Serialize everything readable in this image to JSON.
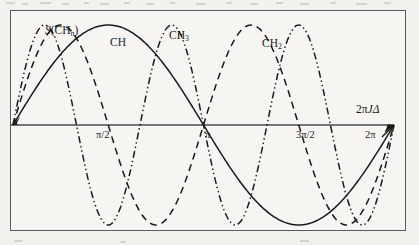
{
  "figure": {
    "axis": {
      "x_axis_label": "2πJΔ",
      "x_axis_label_parts": {
        "prefix": "2π",
        "italic": "J",
        "suffix": "Δ"
      },
      "tick_labels": [
        "π/2",
        "π",
        "3π/2",
        "2π"
      ],
      "tick_values": [
        1.5708,
        3.1416,
        4.7124,
        6.2832
      ]
    },
    "series_labels": {
      "intensity": {
        "italic": "S",
        "rest": "(CH",
        "sub": "n",
        "close": ")"
      },
      "ch": "CH",
      "ch3_main": "CH",
      "ch3_sub": "3",
      "ch2_main": "CH",
      "ch2_sub": "2"
    },
    "colors": {
      "ink": "#1a1a1a",
      "frame": "#5b5b5b",
      "axis": "#4a4a4a",
      "paper": "#f6f5f2",
      "page": "#f2f1ee"
    }
  },
  "chart_data": {
    "type": "line",
    "title": "",
    "xlabel": "2πJΔ",
    "ylabel": "S(CHn)",
    "xlim": [
      0,
      6.2832
    ],
    "ylim": [
      -1.12,
      1.12
    ],
    "grid": false,
    "legend": "inline-curve-labels",
    "x_ticks": [
      1.5708,
      3.1416,
      4.7124,
      6.2832
    ],
    "x_tick_labels": [
      "π/2",
      "π",
      "3π/2",
      "2π"
    ],
    "annotations": [
      {
        "text": "S(CHn)",
        "x": 0.55,
        "y": 1.02
      },
      {
        "text": "CH",
        "x": 1.62,
        "y": 1.06
      },
      {
        "text": "CH3",
        "x": 2.75,
        "y": 1.06
      },
      {
        "text": "CH2",
        "x": 4.35,
        "y": 0.98
      },
      {
        "text": "2πJΔ",
        "x": 6.05,
        "y": 0.21
      }
    ],
    "series": [
      {
        "name": "CH",
        "label": "CH",
        "linestyle": "solid",
        "formula": "sin(x)",
        "x": [
          0,
          0.3927,
          0.7854,
          1.1781,
          1.5708,
          1.9635,
          2.3562,
          2.7489,
          3.1416,
          3.5343,
          3.927,
          4.3197,
          4.7124,
          5.1051,
          5.4978,
          5.8905,
          6.2832
        ],
        "values": [
          0,
          0.383,
          0.707,
          0.924,
          1,
          0.924,
          0.707,
          0.383,
          0,
          -0.383,
          -0.707,
          -0.924,
          -1,
          -0.924,
          -0.707,
          -0.383,
          0
        ]
      },
      {
        "name": "CH2",
        "label": "CH2",
        "linestyle": "dashed",
        "formula": "sin(2x)",
        "x": [
          0,
          0.3927,
          0.7854,
          1.1781,
          1.5708,
          1.9635,
          2.3562,
          2.7489,
          3.1416,
          3.5343,
          3.927,
          4.3197,
          4.7124,
          5.1051,
          5.4978,
          5.8905,
          6.2832
        ],
        "values": [
          0,
          0.707,
          1,
          0.707,
          0,
          -0.707,
          -1,
          -0.707,
          0,
          0.707,
          1,
          0.707,
          0,
          -0.707,
          -1,
          -0.707,
          0
        ]
      },
      {
        "name": "CH3",
        "label": "CH3",
        "linestyle": "dash-dot-dot",
        "formula": "sin(3x)",
        "x": [
          0,
          0.2618,
          0.5236,
          0.7854,
          1.0472,
          1.309,
          1.5708,
          1.8326,
          2.0944,
          2.3562,
          2.618,
          2.8798,
          3.1416,
          3.4034,
          3.6652,
          3.927,
          4.1888,
          4.4506,
          4.7124,
          4.9742,
          5.236,
          5.4978,
          5.7596,
          6.0214,
          6.2832
        ],
        "values": [
          0,
          0.707,
          1,
          0.707,
          0,
          -0.707,
          -1,
          -0.707,
          0,
          0.707,
          1,
          0.707,
          0,
          -0.707,
          -1,
          -0.707,
          0,
          0.707,
          1,
          0.707,
          0,
          -0.707,
          -1,
          -0.707,
          0
        ]
      }
    ]
  }
}
